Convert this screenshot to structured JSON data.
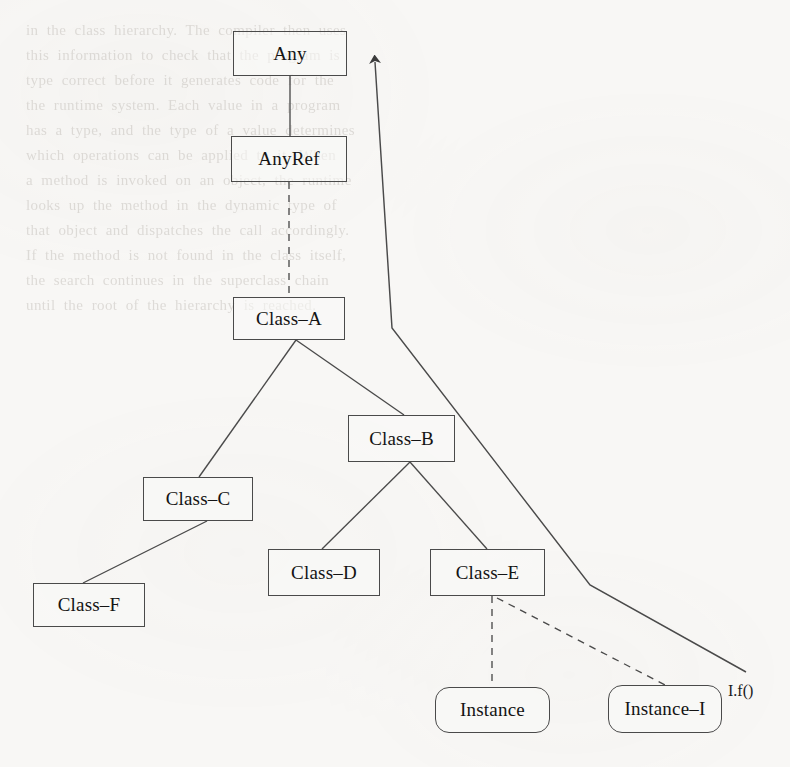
{
  "page": {
    "width": 790,
    "height": 767,
    "background_color": "#f8f7f5",
    "ink_color": "#4a4a4a",
    "text_color": "#141414"
  },
  "diagram": {
    "type": "class-hierarchy",
    "nodes": [
      {
        "id": "any",
        "label": "Any",
        "shape": "rect",
        "x": 233,
        "y": 31,
        "w": 114,
        "h": 45
      },
      {
        "id": "anyref",
        "label": "AnyRef",
        "shape": "rect",
        "x": 231,
        "y": 136,
        "w": 116,
        "h": 46
      },
      {
        "id": "class-a",
        "label": "Class–A",
        "shape": "rect",
        "x": 233,
        "y": 297,
        "w": 112,
        "h": 43
      },
      {
        "id": "class-b",
        "label": "Class–B",
        "shape": "rect",
        "x": 348,
        "y": 415,
        "w": 107,
        "h": 47
      },
      {
        "id": "class-c",
        "label": "Class–C",
        "shape": "rect",
        "x": 143,
        "y": 477,
        "w": 110,
        "h": 44
      },
      {
        "id": "class-f",
        "label": "Class–F",
        "shape": "rect",
        "x": 33,
        "y": 583,
        "w": 112,
        "h": 44
      },
      {
        "id": "class-d",
        "label": "Class–D",
        "shape": "rect",
        "x": 268,
        "y": 549,
        "w": 112,
        "h": 47
      },
      {
        "id": "class-e",
        "label": "Class–E",
        "shape": "rect",
        "x": 430,
        "y": 549,
        "w": 115,
        "h": 47
      },
      {
        "id": "instance",
        "label": "Instance",
        "shape": "rounded",
        "x": 435,
        "y": 687,
        "w": 115,
        "h": 46
      },
      {
        "id": "instance-i",
        "label": "Instance–I",
        "shape": "rounded",
        "x": 608,
        "y": 685,
        "w": 114,
        "h": 48
      }
    ],
    "edges": [
      {
        "id": "any-anyref",
        "from": "any",
        "to": "anyref",
        "style": "solid",
        "points": "290,76 290,136"
      },
      {
        "id": "anyref-class-a",
        "from": "anyref",
        "to": "class-a",
        "style": "dashed",
        "points": "289,182 289,297"
      },
      {
        "id": "class-a-class-c",
        "from": "class-a",
        "to": "class-c",
        "style": "solid",
        "points": "296,340 199,477"
      },
      {
        "id": "class-a-class-b",
        "from": "class-a",
        "to": "class-b",
        "style": "solid",
        "points": "296,340 404,415"
      },
      {
        "id": "class-c-class-f",
        "from": "class-c",
        "to": "class-f",
        "style": "solid",
        "points": "207,521 83,583"
      },
      {
        "id": "class-b-class-d",
        "from": "class-b",
        "to": "class-d",
        "style": "solid",
        "points": "410,462 322,549"
      },
      {
        "id": "class-b-class-e",
        "from": "class-b",
        "to": "class-e",
        "style": "solid",
        "points": "410,462 487,549"
      },
      {
        "id": "class-e-instance",
        "from": "class-e",
        "to": "instance",
        "style": "dashed",
        "points": "492,596 492,687"
      },
      {
        "id": "class-e-instance-i",
        "from": "class-e",
        "to": "instance-i",
        "style": "dashed",
        "points": "497,598 665,685"
      }
    ],
    "arrow": {
      "id": "inheritance-arrow",
      "style": "solid",
      "points": "746,672 590,585 392,328 375,62",
      "head_at": "375,62",
      "description": "long arrow from Instance-I call site up to the top of the hierarchy"
    },
    "free_labels": [
      {
        "id": "call-label",
        "text": "I.f()",
        "x": 728,
        "y": 682
      }
    ]
  },
  "ghost_text": {
    "lines": [
      "in  the  class  hierarchy.  The  compiler  then  uses",
      "this  information  to  check  that  the  program  is",
      "type  correct  before  it  generates  code  for  the",
      "the  runtime  system.  Each  value  in  a  program",
      "has  a  type,  and  the  type  of  a  value  determines",
      "which  operations  can  be  applied  to  it.  When",
      "a  method  is  invoked  on  an  object,  the  runtime",
      "looks  up  the  method  in  the  dynamic  type  of",
      "that  object  and  dispatches  the  call  accordingly.",
      "If  the  method  is  not  found  in  the  class  itself,",
      "the  search  continues  in  the  superclass  chain",
      "until  the  root  of  the  hierarchy  is  reached."
    ]
  }
}
